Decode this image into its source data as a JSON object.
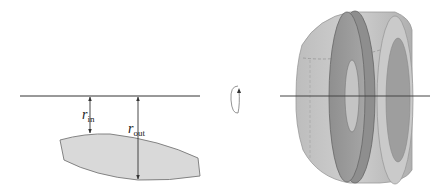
{
  "figure": {
    "left_panel": {
      "axis_line": "axis-of-rotation",
      "labels": {
        "r_in": {
          "symbol": "r",
          "subscript": "in"
        },
        "r_out": {
          "symbol": "r",
          "subscript": "out"
        }
      },
      "region": "shaded-cross-section-region"
    },
    "rotation_symbol": "rotation-arrow-icon",
    "right_panel": {
      "solid": "solid-of-revolution-washer"
    },
    "colors": {
      "line": "#333333",
      "region_fill": "#d9d9d9",
      "region_stroke": "#777777",
      "solid_light": "#c8c8c8",
      "solid_mid": "#a8a8a8",
      "solid_dark": "#8a8a8a"
    }
  }
}
